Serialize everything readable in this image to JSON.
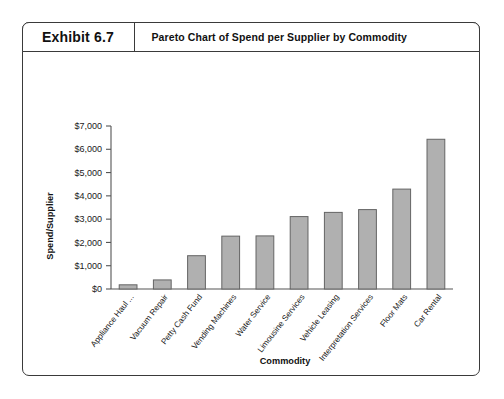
{
  "exhibit": {
    "number": "Exhibit 6.7",
    "title": "Pareto Chart of Spend per Supplier by Commodity"
  },
  "chart_data": {
    "type": "bar",
    "title": "Pareto Chart of Spend per Supplier by Commodity",
    "xlabel": "Commodity",
    "ylabel": "Spend/Supplier",
    "categories": [
      "Appliance Haul ...",
      "Vacuum Repair",
      "Petty Cash Fund",
      "Vending Machines",
      "Water Service",
      "Limousine Services",
      "Vehicle Leasing",
      "Interpretation Services",
      "Floor Mats",
      "Car Rental"
    ],
    "values": [
      180,
      390,
      1430,
      2270,
      2280,
      3110,
      3290,
      3410,
      4290,
      6430
    ],
    "ytick_labels": [
      "$0",
      "$1,000",
      "$2,000",
      "$3,000",
      "$4,000",
      "$5,000",
      "$6,000",
      "$7,000"
    ],
    "ytick_values": [
      0,
      1000,
      2000,
      3000,
      4000,
      5000,
      6000,
      7000
    ],
    "ylim": [
      0,
      7000
    ],
    "grid": false,
    "legend": false,
    "bar_color": "#b0b0b0",
    "bar_edge_color": "#646464"
  }
}
